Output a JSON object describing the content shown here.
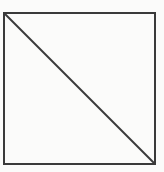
{
  "diagram": {
    "shape": "square-with-diagonal",
    "background_color": "#fbfbfa",
    "stroke_color": "#3a3a3a",
    "stroke_width": 2,
    "square": {
      "x": 4,
      "y": 13,
      "width": 151,
      "height": 151
    },
    "diagonal": {
      "from": [
        4,
        13
      ],
      "to": [
        155,
        164
      ],
      "direction": "top-left-to-bottom-right"
    }
  }
}
